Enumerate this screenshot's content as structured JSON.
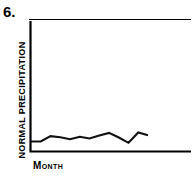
{
  "figure": {
    "number_label": "6.",
    "ink_color": "#000000",
    "background_color": "#ffffff"
  },
  "chart_data": {
    "type": "line",
    "title": "",
    "subtitle": "",
    "xlabel": "MONTH",
    "ylabel": "NORMAL PRECIPITATION",
    "categories": [
      "1",
      "2",
      "3",
      "4",
      "5",
      "6",
      "7",
      "8",
      "9",
      "10",
      "11",
      "12",
      "13"
    ],
    "x": [
      0,
      1,
      2,
      3,
      4,
      5,
      6,
      7,
      8,
      9,
      10,
      11,
      12
    ],
    "values": [
      3.0,
      3.0,
      4.6,
      4.3,
      3.7,
      4.4,
      3.9,
      4.8,
      5.6,
      4.2,
      2.6,
      5.7,
      4.9
    ],
    "series": [
      {
        "name": "Normal precipitation",
        "values": [
          3.0,
          3.0,
          4.6,
          4.3,
          3.7,
          4.4,
          3.9,
          4.8,
          5.6,
          4.2,
          2.6,
          5.7,
          4.9
        ]
      }
    ],
    "xlim": [
      0,
      12
    ],
    "ylim": [
      0,
      10
    ],
    "grid": false,
    "legend": false,
    "legend_position": "none",
    "tick_labels_x": [],
    "tick_labels_y": [],
    "annotations": []
  },
  "axes": {
    "x_axis_name": "horizontal-axis",
    "y_axis_name": "vertical-axis"
  }
}
